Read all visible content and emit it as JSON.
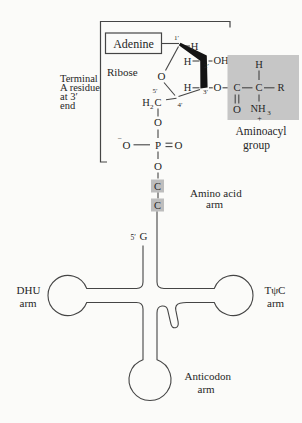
{
  "colors": {
    "bg": "#fbfbf9",
    "line": "#454545",
    "text": "#262626",
    "shade": "#c6c6c6",
    "cbox": "#bdbdbd",
    "wedge": "#141414"
  },
  "terminal_label": {
    "l1": "Terminal",
    "l2": "A residue",
    "l3": "at 3′",
    "l4": "end"
  },
  "adenine_box": {
    "label": "Adenine"
  },
  "ribose_label": "Ribose",
  "ring": {
    "o": "O",
    "c1_prime": "1′",
    "h1": "H",
    "h2": "H",
    "c2_prime": "2′",
    "oh": "OH",
    "h3": "H",
    "c3_prime": "3′",
    "o3": "O",
    "c4_prime": "4′",
    "c5_prime": "5′",
    "h2c_h": "H",
    "h2c_sub": "2",
    "h2c_c": "C"
  },
  "phosphate": {
    "o_top": "O",
    "minus": "−",
    "o_left": "O",
    "p": "P",
    "o_right": "O",
    "o_bottom": "O"
  },
  "c_residues": {
    "c1": "C",
    "c2": "C"
  },
  "aminoacyl": {
    "h": "H",
    "c1": "C",
    "c2": "C",
    "r": "R",
    "o": "O",
    "nh": "NH",
    "sub": "3",
    "plus": "+",
    "label1": "Aminoacyl",
    "label2": "group"
  },
  "amino_acid_arm": {
    "l1": "Amino acid",
    "l2": "arm"
  },
  "five_prime_end": {
    "prime": "5′",
    "g": "G"
  },
  "dhu_arm": {
    "l1": "DHU",
    "l2": "arm"
  },
  "tpsic_arm": {
    "l1": "TψC",
    "l2": "arm"
  },
  "anticodon_arm": {
    "l1": "Anticodon",
    "l2": "arm"
  }
}
